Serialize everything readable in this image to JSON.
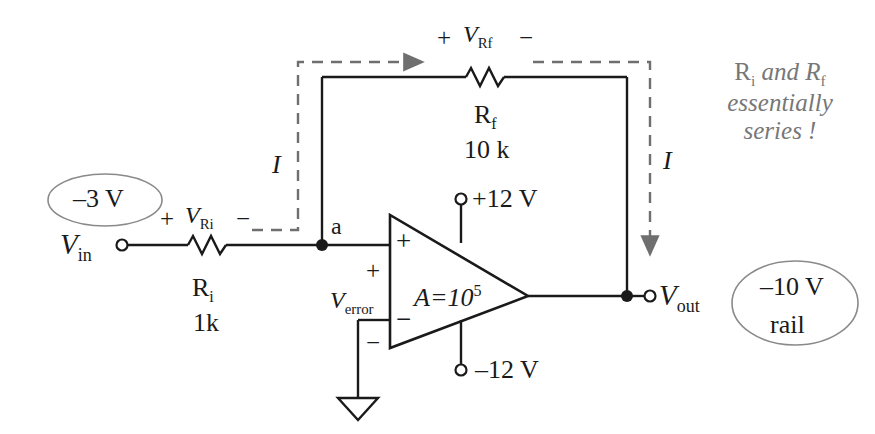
{
  "diagram": {
    "colors": {
      "wire": "#1a1a1a",
      "dashed_current": "#6f6f6f",
      "annotation_text": "#777777",
      "callout_ellipse_stroke": "#8a8a8a",
      "text": "#1a1a1a"
    }
  },
  "labels": {
    "v_in": "V",
    "v_in_sub": "in",
    "v_out": "V",
    "v_out_sub": "out",
    "node_a": "a",
    "current_left": "I",
    "current_right": "I",
    "gain": "A=10",
    "gain_exp": "5",
    "supply_pos": "+12 V",
    "supply_neg": "–12 V",
    "opamp_in_plus": "+",
    "opamp_in_minus": "−",
    "v_error": "V",
    "v_error_sub": "error",
    "v_error_plus": "+",
    "v_error_minus": "−"
  },
  "resistors": {
    "input": {
      "name": "R",
      "name_sub": "i",
      "value": "1k",
      "drop_plus": "+",
      "drop_label": "V",
      "drop_label_sub": "Ri",
      "drop_minus": "−"
    },
    "feedback": {
      "name": "R",
      "name_sub": "f",
      "value": "10 k",
      "drop_plus": "+",
      "drop_label": "V",
      "drop_label_sub": "Rf",
      "drop_minus": "−"
    }
  },
  "callouts": [
    {
      "id": "input-voltage-callout",
      "lines": [
        "–3 V"
      ]
    },
    {
      "id": "output-rail-callout",
      "lines": [
        "–10 V",
        "rail"
      ]
    }
  ],
  "callout_input": {
    "line1": "–3 V"
  },
  "callout_output": {
    "line1": "–10 V",
    "line2": "rail"
  },
  "annotation": {
    "line1_a": "R",
    "line1_a_sub": "i",
    "line1_b": " and R",
    "line1_b_sub": "f",
    "line2": "essentially",
    "line3": "series !"
  }
}
